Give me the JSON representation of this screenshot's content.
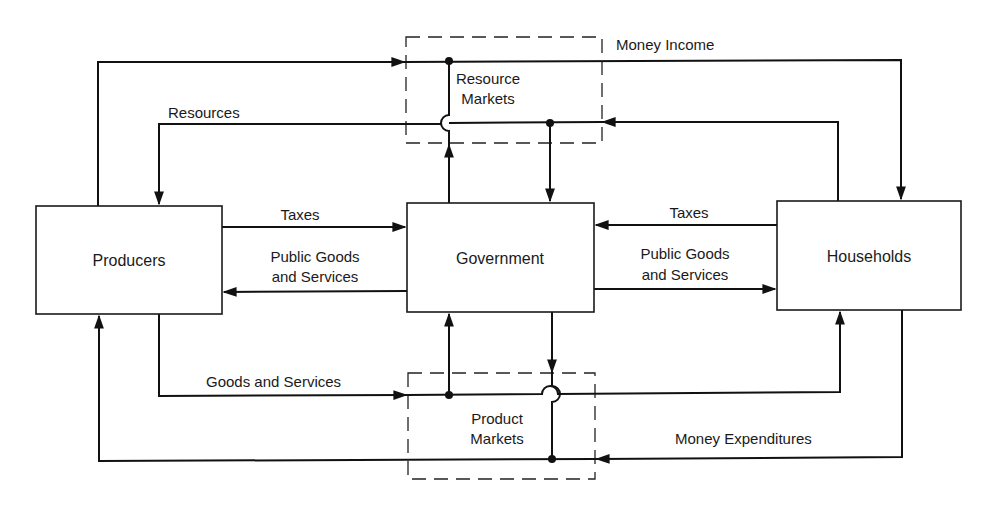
{
  "diagram": {
    "type": "circular-flow",
    "sectors": {
      "producers": "Producers",
      "government": "Government",
      "households": "Households"
    },
    "markets": {
      "resource": [
        "Resource",
        "Markets"
      ],
      "product": [
        "Product",
        "Markets"
      ]
    },
    "flows": {
      "money_income": "Money Income",
      "resources": "Resources",
      "taxes_left": "Taxes",
      "taxes_right": "Taxes",
      "public_goods_left": [
        "Public Goods",
        "and Services"
      ],
      "public_goods_right": [
        "Public Goods",
        "and Services"
      ],
      "goods_and_services": "Goods and Services",
      "money_expenditures": "Money Expenditures"
    },
    "colors": {
      "line": "#111111",
      "background": "#ffffff"
    }
  }
}
